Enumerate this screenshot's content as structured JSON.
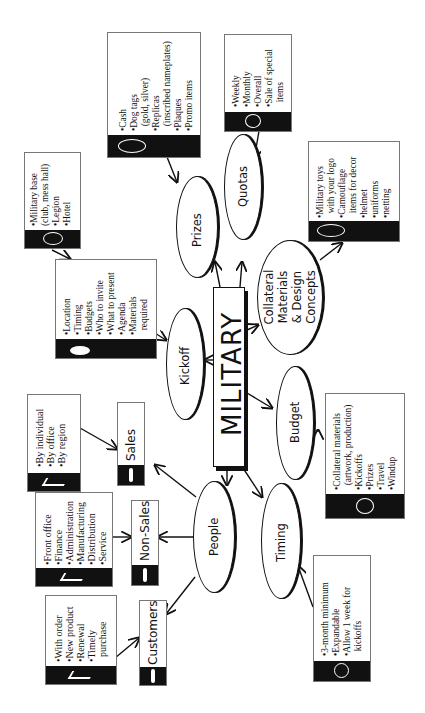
{
  "center": {
    "label": "MILITARY"
  },
  "nodes": {
    "kickoff": {
      "label": "Kickoff",
      "icon": "hand-pointing-icon",
      "items": [
        "•Location",
        "•Timing",
        "•Budgets",
        "•Who to invite",
        "•What to present",
        "•Agenda",
        "•Materials",
        "  required"
      ]
    },
    "kickoff_venue": {
      "icon": "lightbulb-icon",
      "items": [
        "•Military base",
        "(club, mess hall)",
        "•Legion",
        "•Hotel"
      ]
    },
    "prizes": {
      "label": "Prizes",
      "icon": "lightbulb-icon",
      "items": [
        "•Cash",
        "•Dog tags",
        "  (gold, silver)",
        "•Replicas",
        "  (inscribed nameplates)",
        "•Plaques",
        "•Promo items"
      ]
    },
    "quotas": {
      "label": "Quotas",
      "icon": "money-icon",
      "items": [
        "•Weekly",
        "•Monthly",
        "•Overall",
        "•Sale of special",
        "  items"
      ]
    },
    "collateral": {
      "label_lines": [
        "Collateral",
        "Materials",
        "& Design",
        "Concepts"
      ],
      "icon": "lightbulb-icon",
      "items": [
        "•Military toys",
        "  with your logo",
        "•Camouflage",
        "  items for decor",
        "•helmet",
        "•uniforms",
        "•netting"
      ]
    },
    "budget": {
      "label": "Budget",
      "icon": "money-icon",
      "items": [
        "•Collateral materials",
        "  (artwork, production)",
        "•Kickoffs",
        "•Prizes",
        "•Travel",
        "•Windup"
      ]
    },
    "timing": {
      "label": "Timing",
      "icon": "clock-icon",
      "items": [
        "•3-month minimum",
        "•Expandable",
        "•Allow 1 week for",
        "  kickoffs"
      ]
    },
    "people": {
      "label": "People"
    },
    "sales": {
      "label": "Sales",
      "icon": "person-icon",
      "items_icon": "checkmark-icon",
      "items": [
        "•By individual",
        "•By office",
        "•By region"
      ]
    },
    "nonsales": {
      "label": "Non-Sales",
      "icon": "person-icon",
      "items_icon": "checkmark-icon",
      "items": [
        "•Front office",
        "•Finance",
        "•Administration",
        "•Manufacturing",
        "•Distribution",
        "•Service"
      ]
    },
    "customers": {
      "label": "Customers",
      "icon": "person-icon",
      "items_icon": "checkmark-icon",
      "items": [
        "•With order",
        "•New product",
        "•Renewal",
        "•Timely",
        "  purchase"
      ]
    }
  },
  "colors": {
    "ink": "#111111",
    "border": "#777777",
    "paper": "#ffffff"
  }
}
